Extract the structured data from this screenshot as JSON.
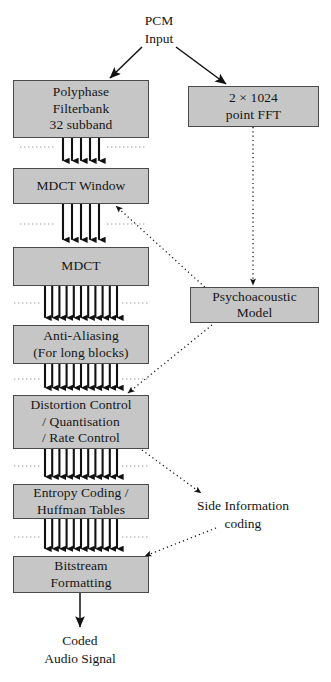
{
  "diagram": {
    "colors": {
      "box_fill": "#c6c6c6",
      "box_stroke": "#4a4a4a",
      "text": "#151515",
      "arrow": "#111111",
      "dotted": "#3a3a3a",
      "background": "#ffffff"
    },
    "labels": {
      "pcm_input": {
        "line1": "PCM",
        "line2": "Input"
      },
      "side_information": {
        "line1": "Side Information",
        "line2": "coding"
      },
      "coded_audio": {
        "line1": "Coded",
        "line2": "Audio Signal"
      }
    },
    "boxes": [
      {
        "id": "polyphase-filterbank",
        "lines": [
          "Polyphase",
          "Filterbank",
          "32 subband"
        ],
        "x": 13,
        "y": 80,
        "w": 136,
        "h": 58
      },
      {
        "id": "fft",
        "lines": [
          "2 × 1024",
          "point FFT"
        ],
        "x": 188,
        "y": 86,
        "w": 131,
        "h": 41
      },
      {
        "id": "mdct-window",
        "lines": [
          "MDCT Window"
        ],
        "x": 13,
        "y": 168,
        "w": 136,
        "h": 36
      },
      {
        "id": "mdct",
        "lines": [
          "MDCT"
        ],
        "x": 13,
        "y": 247,
        "w": 136,
        "h": 39
      },
      {
        "id": "psychoacoustic-model",
        "lines": [
          "Psychoacoustic",
          "Model"
        ],
        "x": 190,
        "y": 287,
        "w": 129,
        "h": 36
      },
      {
        "id": "anti-aliasing",
        "lines": [
          "Anti-Aliasing",
          "(For long blocks)"
        ],
        "x": 13,
        "y": 325,
        "w": 136,
        "h": 39
      },
      {
        "id": "distortion-control",
        "lines": [
          "Distortion Control",
          "/ Quantisation",
          "/ Rate Control"
        ],
        "x": 13,
        "y": 395,
        "w": 136,
        "h": 54
      },
      {
        "id": "entropy-coding",
        "lines": [
          "Entropy Coding /",
          "Huffman Tables"
        ],
        "x": 13,
        "y": 484,
        "w": 136,
        "h": 35
      },
      {
        "id": "bitstream-formatting",
        "lines": [
          "Bitstream",
          "Formatting"
        ],
        "x": 13,
        "y": 556,
        "w": 136,
        "h": 37
      }
    ],
    "flow_arrow_groups": [
      {
        "id": "polyphase-to-mdct-window",
        "count": 5,
        "x_start": 63,
        "x_end": 99,
        "y_top": 138,
        "y_bottom": 167
      },
      {
        "id": "mdct-window-to-mdct",
        "count": 5,
        "x_start": 63,
        "x_end": 99,
        "y_top": 204,
        "y_bottom": 246
      },
      {
        "id": "mdct-to-anti-aliasing",
        "count": 11,
        "x_start": 45,
        "x_end": 117,
        "y_top": 286,
        "y_bottom": 324
      },
      {
        "id": "anti-aliasing-to-distortion",
        "count": 11,
        "x_start": 45,
        "x_end": 117,
        "y_top": 364,
        "y_bottom": 394
      },
      {
        "id": "distortion-to-entropy",
        "count": 11,
        "x_start": 45,
        "x_end": 117,
        "y_top": 449,
        "y_bottom": 483
      },
      {
        "id": "entropy-to-bitstream",
        "count": 11,
        "x_start": 45,
        "x_end": 117,
        "y_top": 519,
        "y_bottom": 555
      }
    ],
    "dotted_separators": [
      {
        "id": "sep-1",
        "y": 147,
        "segments": [
          [
            20,
            55
          ],
          [
            107,
            145
          ]
        ]
      },
      {
        "id": "sep-2",
        "y": 224,
        "segments": [
          [
            20,
            55
          ],
          [
            107,
            145
          ]
        ]
      },
      {
        "id": "sep-3",
        "y": 303,
        "segments": [
          [
            14,
            40
          ],
          [
            122,
            148
          ]
        ]
      },
      {
        "id": "sep-4",
        "y": 379,
        "segments": [
          [
            14,
            40
          ],
          [
            122,
            148
          ]
        ]
      },
      {
        "id": "sep-5",
        "y": 466,
        "segments": [
          [
            14,
            40
          ],
          [
            122,
            148
          ]
        ]
      },
      {
        "id": "sep-6",
        "y": 537,
        "segments": [
          [
            14,
            40
          ],
          [
            122,
            148
          ]
        ]
      }
    ],
    "connectors": [
      {
        "id": "pcm-to-polyphase",
        "style": "solid",
        "x1": 142,
        "y1": 47,
        "x2": 110,
        "y2": 78
      },
      {
        "id": "pcm-to-fft",
        "style": "solid",
        "x1": 176,
        "y1": 47,
        "x2": 226,
        "y2": 84
      },
      {
        "id": "fft-to-psychoacoustic",
        "style": "dotted",
        "x1": 253,
        "y1": 127,
        "x2": 253,
        "y2": 285
      },
      {
        "id": "psychoacoustic-to-mdct-window",
        "style": "dotted",
        "x1": 208,
        "y1": 290,
        "x2": 116,
        "y2": 206
      },
      {
        "id": "psychoacoustic-to-distortion",
        "style": "dotted",
        "x1": 212,
        "y1": 325,
        "x2": 128,
        "y2": 393
      },
      {
        "id": "distortion-to-side-info",
        "style": "dotted",
        "x1": 142,
        "y1": 450,
        "x2": 201,
        "y2": 493
      },
      {
        "id": "side-info-to-bitstream",
        "style": "dotted",
        "x1": 216,
        "y1": 528,
        "x2": 145,
        "y2": 556
      },
      {
        "id": "bitstream-to-output",
        "style": "solid",
        "x1": 80,
        "y1": 593,
        "x2": 80,
        "y2": 627
      }
    ],
    "free_texts": [
      {
        "id": "pcm-input",
        "x": 159,
        "y": 12,
        "lines": [
          "PCM",
          "Input"
        ]
      },
      {
        "id": "side-information",
        "x": 243,
        "y": 497,
        "lines": [
          "Side Information",
          "coding"
        ]
      },
      {
        "id": "coded-audio",
        "x": 80,
        "y": 632,
        "lines": [
          "Coded",
          "Audio Signal"
        ]
      }
    ]
  }
}
